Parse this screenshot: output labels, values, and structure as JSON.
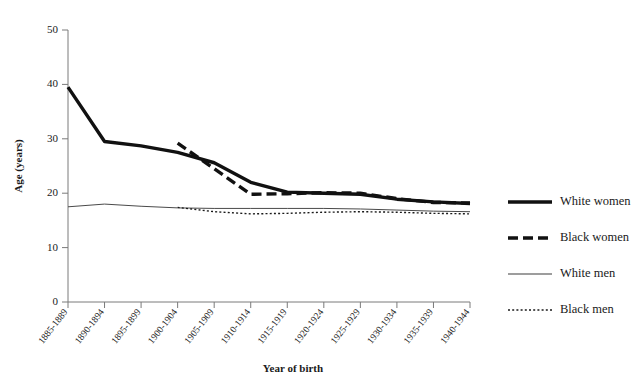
{
  "chart_data": {
    "type": "line",
    "title": "",
    "xlabel": "Year of birth",
    "ylabel": "Age (years)",
    "ylim": [
      0,
      50
    ],
    "yticks": [
      0,
      10,
      20,
      30,
      40,
      50
    ],
    "grid": false,
    "legend_position": "right",
    "categories": [
      "1885-1889",
      "1890-1894",
      "1895-1899",
      "1900-1904",
      "1905-1909",
      "1910-1914",
      "1915-1919",
      "1920-1924",
      "1925-1929",
      "1930-1934",
      "1935-1939",
      "1940-1944"
    ],
    "series": [
      {
        "name": "White women",
        "style": "thick-solid",
        "color": "#111111",
        "values": [
          39.5,
          29.5,
          28.7,
          27.5,
          25.6,
          22.0,
          20.2,
          20.0,
          19.8,
          18.9,
          18.4,
          18.1
        ]
      },
      {
        "name": "Black women",
        "style": "thick-dashed",
        "color": "#111111",
        "values": [
          null,
          null,
          null,
          29.2,
          24.5,
          19.8,
          19.9,
          20.1,
          20.0,
          19.0,
          18.3,
          18.2
        ]
      },
      {
        "name": "White men",
        "style": "thin-solid",
        "color": "#4a4a4a",
        "values": [
          17.5,
          18.0,
          17.6,
          17.3,
          17.2,
          17.2,
          17.2,
          17.2,
          17.1,
          16.9,
          16.7,
          16.6
        ]
      },
      {
        "name": "Black men",
        "style": "thin-dotted",
        "color": "#1a1a1a",
        "values": [
          null,
          null,
          null,
          17.4,
          16.6,
          16.2,
          16.3,
          16.5,
          16.6,
          16.5,
          16.3,
          16.2
        ]
      }
    ]
  },
  "legend": {
    "items": [
      {
        "label": "White women",
        "style": "thick-solid"
      },
      {
        "label": "Black women",
        "style": "thick-dashed"
      },
      {
        "label": "White men",
        "style": "thin-solid"
      },
      {
        "label": "Black men",
        "style": "thin-dotted"
      }
    ]
  },
  "colors": {
    "axis": "#7a7a7a",
    "text": "#1a1a1a",
    "series_dark": "#111111",
    "series_light": "#4a4a4a",
    "background": "#ffffff"
  }
}
